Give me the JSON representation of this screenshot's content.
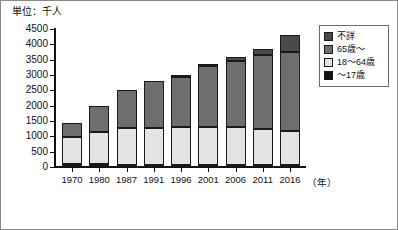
{
  "unit_label": "単位：千人",
  "year_axis_label": "（年）",
  "legend": {
    "items": [
      {
        "label": "不詳",
        "color": "#4a4a4a"
      },
      {
        "label": "65歳～",
        "color": "#6e6e6e"
      },
      {
        "label": "18～64歳",
        "color": "#e3e3e3"
      },
      {
        "label": "～17歳",
        "color": "#111111"
      }
    ]
  },
  "chart_data": {
    "type": "bar",
    "title": "単位：千人",
    "subtitle": "",
    "xlabel": "（年）",
    "ylabel": "単位：千人",
    "stacked": true,
    "grid": false,
    "legend_position": "top-right",
    "ylim": [
      0,
      4500
    ],
    "yticks": [
      0,
      500,
      1000,
      1500,
      2000,
      2500,
      3000,
      3500,
      4000,
      4500
    ],
    "ytick_labels": [
      "0",
      "500",
      "1000",
      "1500",
      "2000",
      "2500",
      "3000",
      "3500",
      "4000",
      "4500"
    ],
    "categories": [
      "1970",
      "1980",
      "1987",
      "1991",
      "1996",
      "2001",
      "2006",
      "2011",
      "2016"
    ],
    "series": [
      {
        "name": "～17歳",
        "color": "#111111",
        "values": [
          100,
          90,
          80,
          80,
          80,
          70,
          70,
          70,
          70
        ]
      },
      {
        "name": "18～64歳",
        "color": "#e3e3e3",
        "values": [
          880,
          1060,
          1190,
          1200,
          1210,
          1230,
          1240,
          1170,
          1110
        ]
      },
      {
        "name": "65歳～",
        "color": "#6e6e6e",
        "values": [
          450,
          830,
          1230,
          1510,
          1660,
          2010,
          2160,
          2410,
          2580
        ]
      },
      {
        "name": "不詳",
        "color": "#4a4a4a",
        "values": [
          0,
          0,
          0,
          0,
          50,
          30,
          110,
          210,
          530
        ]
      }
    ],
    "totals": [
      1430,
      1980,
      2500,
      2790,
      3000,
      3340,
      3580,
      3860,
      4290
    ]
  }
}
